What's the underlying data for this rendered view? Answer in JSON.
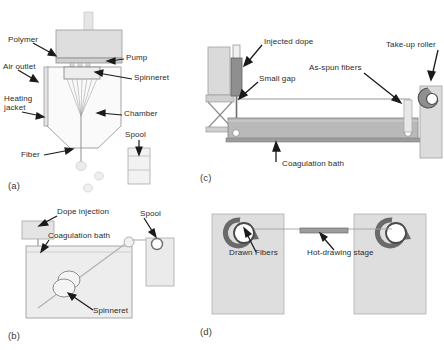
{
  "figure": {
    "background_color": "#ffffff",
    "width": 444,
    "height": 350
  },
  "palette": {
    "line": "#6f6f6f",
    "dark_line": "#3a3a3a",
    "arrow": "#1a1a1a",
    "text": "#2b2b2b",
    "fill_light": "#e8e8e8",
    "fill_mid": "#d2d2d2",
    "fill_dark": "#b4b4b4",
    "bath_fill": "#b9b9b9",
    "block_fill": "#dcdcdc"
  },
  "panels": [
    {
      "id": "a",
      "label": "(a)",
      "name": "melt-spinning-apparatus",
      "labels": [
        {
          "key": "polymer",
          "text": "Polymer"
        },
        {
          "key": "air_outlet",
          "text": "Air outlet"
        },
        {
          "key": "heating_jacket",
          "text": "Heating\njacket"
        },
        {
          "key": "heating_jacket_l1",
          "text": "Heating"
        },
        {
          "key": "heating_jacket_l2",
          "text": "jacket"
        },
        {
          "key": "pump",
          "text": "Pump"
        },
        {
          "key": "spinneret",
          "text": "Spinneret"
        },
        {
          "key": "chamber",
          "text": "Chamber"
        },
        {
          "key": "fiber",
          "text": "Fiber"
        },
        {
          "key": "spool",
          "text": "Spool"
        }
      ]
    },
    {
      "id": "b",
      "label": "(b)",
      "name": "wet-spinning-bath",
      "labels": [
        {
          "key": "dope_injection",
          "text": "Dope injection"
        },
        {
          "key": "coagulation_bath",
          "text": "Coagulation bath"
        },
        {
          "key": "spinneret",
          "text": "Spinneret"
        },
        {
          "key": "spool",
          "text": "Spool"
        }
      ]
    },
    {
      "id": "c",
      "label": "(c)",
      "name": "dry-jet-wet-spinning-line",
      "labels": [
        {
          "key": "injected_dope",
          "text": "Injected dope"
        },
        {
          "key": "small_gap",
          "text": "Small gap"
        },
        {
          "key": "as_spun_fibers",
          "text": "As-spun fibers"
        },
        {
          "key": "take_up_roller",
          "text": "Take-up roller"
        },
        {
          "key": "coagulation_bath",
          "text": "Coagulation bath"
        }
      ]
    },
    {
      "id": "d",
      "label": "(d)",
      "name": "hot-drawing-line",
      "labels": [
        {
          "key": "drawn_fibers",
          "text": "Drawn Fibers"
        },
        {
          "key": "hot_drawing_stage",
          "text": "Hot-drawing stage"
        }
      ]
    }
  ]
}
